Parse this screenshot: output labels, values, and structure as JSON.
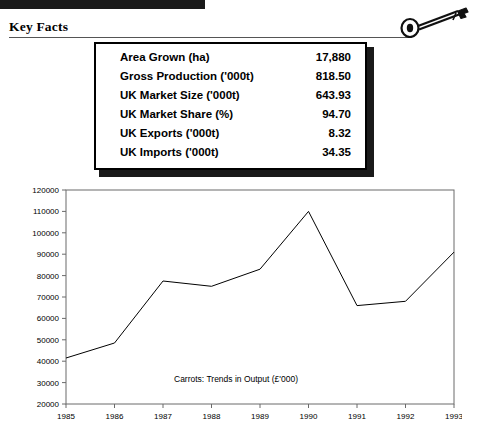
{
  "header": {
    "title": "Key Facts",
    "icon": "key-icon",
    "bar_color": "#1a1a1a"
  },
  "facts": {
    "rows": [
      {
        "label": "Area Grown (ha)",
        "value": "17,880"
      },
      {
        "label": "Gross Production ('000t)",
        "value": "818.50"
      },
      {
        "label": "UK Market Size ('000t)",
        "value": "643.93"
      },
      {
        "label": "UK Market Share (%)",
        "value": "94.70"
      },
      {
        "label": "UK Exports ('000t)",
        "value": "8.32"
      },
      {
        "label": "UK Imports ('000t)",
        "value": "34.35"
      }
    ]
  },
  "chart_data": {
    "type": "line",
    "title": "Carrots: Trends in Output (£'000)",
    "xlabel": "",
    "ylabel": "",
    "categories": [
      "1985",
      "1986",
      "1987",
      "1988",
      "1989",
      "1990",
      "1991",
      "1992",
      "1993"
    ],
    "values": [
      41500,
      48500,
      77500,
      75000,
      83000,
      110000,
      66000,
      68000,
      91000
    ],
    "ylim": [
      20000,
      120000
    ],
    "ytick_labels": [
      "120000",
      "110000",
      "100000",
      "90000",
      "80000",
      "70000",
      "60000",
      "50000",
      "40000",
      "30000",
      "20000"
    ],
    "ytick_values": [
      120000,
      110000,
      100000,
      90000,
      80000,
      70000,
      60000,
      50000,
      40000,
      30000,
      20000
    ],
    "grid": false,
    "legend": "none",
    "line_color": "#000000"
  }
}
